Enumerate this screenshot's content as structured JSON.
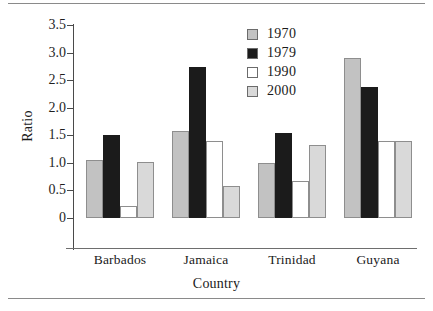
{
  "chart_data": {
    "type": "bar",
    "title": "",
    "xlabel": "Country",
    "ylabel": "Ratio",
    "ylim": [
      0,
      3.5
    ],
    "yticks": [
      "0",
      "0.5",
      "1.0",
      "1.5",
      "2.0",
      "2.5",
      "3.0",
      "3.5"
    ],
    "ytick_values": [
      0,
      0.5,
      1.0,
      1.5,
      2.0,
      2.5,
      3.0,
      3.5
    ],
    "grid": false,
    "legend_position": "top-right",
    "categories": [
      "Barbados",
      "Jamaica",
      "Trinidad",
      "Guyana"
    ],
    "series": [
      {
        "name": "1970",
        "color": "#c2c2c2",
        "values": [
          1.05,
          1.57,
          0.99,
          2.9
        ]
      },
      {
        "name": "1979",
        "color": "#1b1b1b",
        "values": [
          1.5,
          2.73,
          1.54,
          2.38
        ]
      },
      {
        "name": "1990",
        "color": "#ffffff",
        "values": [
          0.22,
          1.4,
          0.68,
          1.4
        ]
      },
      {
        "name": "2000",
        "color": "#d9d9d9",
        "values": [
          1.02,
          0.58,
          1.33,
          1.4
        ]
      }
    ]
  },
  "axes": {
    "ylabel": "Ratio",
    "xlabel": "Country"
  },
  "legend": {
    "items": [
      {
        "label": "1970"
      },
      {
        "label": "1979"
      },
      {
        "label": "1990"
      },
      {
        "label": "2000"
      }
    ]
  }
}
